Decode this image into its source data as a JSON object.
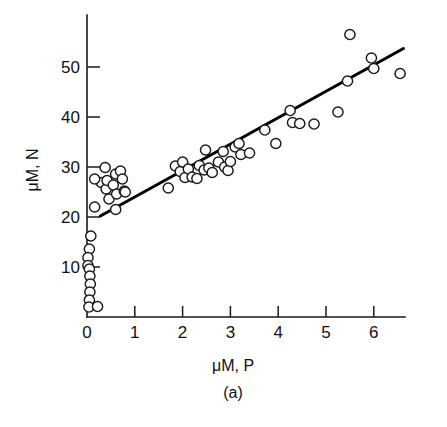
{
  "figure": {
    "caption": "(a)",
    "background_color": "#ffffff",
    "marker_color": "#ffffff",
    "marker_edge_color": "#1a1a1a",
    "line_color": "#000000"
  },
  "chart_data": {
    "type": "scatter",
    "title": "",
    "xlabel": "μM, P",
    "ylabel": "μM, N",
    "caption": "(a)",
    "grid": false,
    "legend": null,
    "xlim": [
      0,
      7
    ],
    "ylim": [
      0,
      60
    ],
    "xticks": [
      0,
      1,
      2,
      3,
      4,
      5,
      6
    ],
    "xtick_labels": [
      "0",
      "1",
      "2",
      "3",
      "4",
      "5",
      "6"
    ],
    "yticks": [
      10,
      20,
      30,
      40,
      50
    ],
    "ytick_labels": [
      "10",
      "20",
      "30",
      "40",
      "50"
    ],
    "tick_direction": "in",
    "series": [
      {
        "name": "observations",
        "marker": "open-circle",
        "points": [
          [
            0.08,
            16.2
          ],
          [
            0.05,
            13.6
          ],
          [
            0.02,
            11.9
          ],
          [
            0.02,
            10.3
          ],
          [
            0.05,
            9.6
          ],
          [
            0.06,
            8.2
          ],
          [
            0.07,
            6.6
          ],
          [
            0.06,
            5.0
          ],
          [
            0.05,
            3.4
          ],
          [
            0.04,
            2.0
          ],
          [
            0.22,
            2.1
          ],
          [
            0.16,
            22.0
          ],
          [
            0.3,
            26.9
          ],
          [
            0.16,
            27.6
          ],
          [
            0.38,
            29.9
          ],
          [
            0.4,
            25.6
          ],
          [
            0.42,
            27.3
          ],
          [
            0.46,
            23.6
          ],
          [
            0.55,
            26.4
          ],
          [
            0.6,
            28.6
          ],
          [
            0.62,
            24.6
          ],
          [
            0.7,
            29.2
          ],
          [
            0.74,
            27.6
          ],
          [
            0.78,
            25.2
          ],
          [
            0.8,
            25.0
          ],
          [
            0.6,
            21.5
          ],
          [
            1.7,
            25.8
          ],
          [
            1.85,
            30.2
          ],
          [
            1.95,
            29.1
          ],
          [
            2.0,
            31.0
          ],
          [
            2.05,
            27.9
          ],
          [
            2.12,
            29.6
          ],
          [
            2.2,
            28.0
          ],
          [
            2.3,
            27.7
          ],
          [
            2.35,
            30.3
          ],
          [
            2.45,
            29.4
          ],
          [
            2.48,
            33.4
          ],
          [
            2.55,
            29.8
          ],
          [
            2.62,
            28.9
          ],
          [
            2.75,
            31.0
          ],
          [
            2.85,
            33.1
          ],
          [
            2.88,
            30.0
          ],
          [
            2.95,
            29.3
          ],
          [
            3.0,
            31.1
          ],
          [
            3.1,
            34.0
          ],
          [
            3.18,
            34.7
          ],
          [
            3.22,
            32.5
          ],
          [
            3.4,
            32.8
          ],
          [
            3.72,
            37.4
          ],
          [
            3.95,
            34.7
          ],
          [
            4.25,
            41.3
          ],
          [
            4.3,
            38.9
          ],
          [
            4.45,
            38.7
          ],
          [
            4.75,
            38.6
          ],
          [
            5.25,
            41.0
          ],
          [
            5.45,
            47.2
          ],
          [
            5.5,
            56.5
          ],
          [
            5.95,
            51.8
          ],
          [
            6.0,
            49.7
          ],
          [
            6.55,
            48.7
          ]
        ]
      }
    ],
    "fit_line": {
      "type": "linear",
      "x_start": 0.28,
      "y_start": 20.2,
      "x_end": 6.62,
      "y_end": 53.7
    }
  }
}
